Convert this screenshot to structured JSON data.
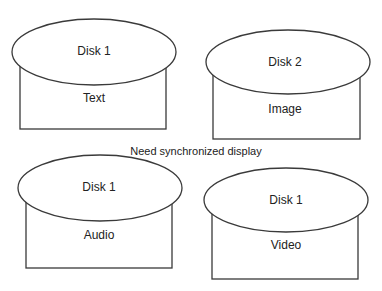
{
  "diagram": {
    "caption": "Need synchronized display",
    "disks": [
      {
        "disk_label": "Disk 1",
        "media_label": "Text"
      },
      {
        "disk_label": "Disk 2",
        "media_label": "Image"
      },
      {
        "disk_label": "Disk 1",
        "media_label": "Audio"
      },
      {
        "disk_label": "Disk 1",
        "media_label": "Video"
      }
    ]
  }
}
